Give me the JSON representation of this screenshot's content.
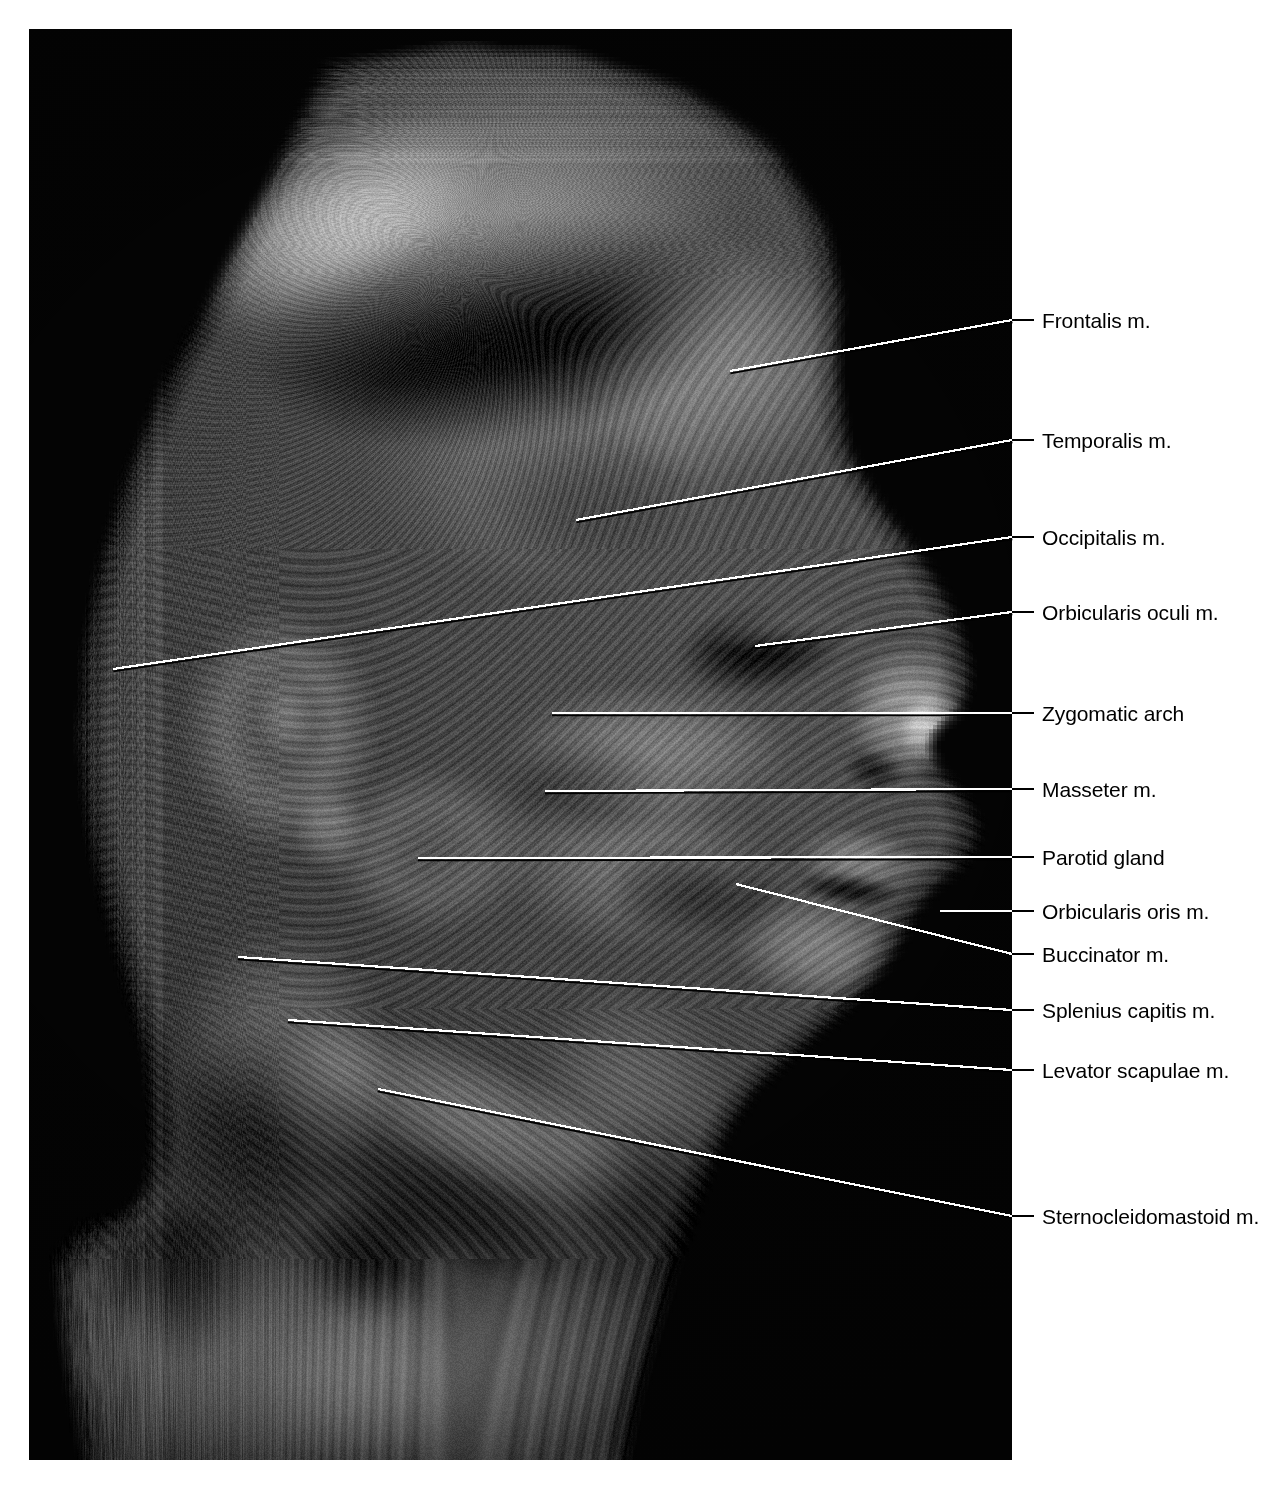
{
  "plate": {
    "title": "Lateral view of head and neck — superficial dissection",
    "width": 1287,
    "height": 1489,
    "background_color": "#ffffff",
    "photo": {
      "x": 29,
      "y": 29,
      "width": 983,
      "height": 1431,
      "background_color": "#000000",
      "description": "Black-and-white cadaveric dissection photograph, right lateral view of head and neck, scalp reflected, facial and cervical musculature exposed"
    },
    "leader_line_colors": {
      "inside_photo": "#ffffff",
      "outside_photo": "#000000"
    },
    "label_text_color": "#000000",
    "label_font_size_px": 21,
    "label_left_x": 1042
  },
  "labels": [
    {
      "id": "frontalis",
      "text": "Frontalis m.",
      "text_y": 320,
      "stub_x1": 1012,
      "stub_x2": 1034,
      "stub_y": 320,
      "anchor_x": 730,
      "anchor_y": 371
    },
    {
      "id": "temporalis",
      "text": "Temporalis m.",
      "text_y": 440,
      "stub_x1": 1012,
      "stub_x2": 1034,
      "stub_y": 440,
      "anchor_x": 576,
      "anchor_y": 520
    },
    {
      "id": "occipitalis",
      "text": "Occipitalis m.",
      "text_y": 537,
      "stub_x1": 1012,
      "stub_x2": 1034,
      "stub_y": 537,
      "anchor_x": 113,
      "anchor_y": 669
    },
    {
      "id": "orbicularis-oculi",
      "text": "Orbicularis oculi m.",
      "text_y": 612,
      "stub_x1": 1012,
      "stub_x2": 1034,
      "stub_y": 612,
      "anchor_x": 755,
      "anchor_y": 646
    },
    {
      "id": "zygomatic-arch",
      "text": "Zygomatic arch",
      "text_y": 713,
      "stub_x1": 1012,
      "stub_x2": 1034,
      "stub_y": 713,
      "anchor_x": 552,
      "anchor_y": 713
    },
    {
      "id": "masseter",
      "text": "Masseter m.",
      "text_y": 789,
      "stub_x1": 1012,
      "stub_x2": 1034,
      "stub_y": 789,
      "anchor_x": 545,
      "anchor_y": 791
    },
    {
      "id": "parotid-gland",
      "text": "Parotid gland",
      "text_y": 857,
      "stub_x1": 1012,
      "stub_x2": 1034,
      "stub_y": 857,
      "anchor_x": 418,
      "anchor_y": 858
    },
    {
      "id": "orbicularis-oris",
      "text": "Orbicularis oris m.",
      "text_y": 911,
      "stub_x1": 1012,
      "stub_x2": 1034,
      "stub_y": 911,
      "anchor_x": 940,
      "anchor_y": 911
    },
    {
      "id": "buccinator",
      "text": "Buccinator m.",
      "text_y": 954,
      "stub_x1": 1012,
      "stub_x2": 1034,
      "stub_y": 954,
      "anchor_x": 736,
      "anchor_y": 884
    },
    {
      "id": "splenius-capitis",
      "text": "Splenius capitis m.",
      "text_y": 1010,
      "stub_x1": 1012,
      "stub_x2": 1034,
      "stub_y": 1010,
      "anchor_x": 238,
      "anchor_y": 957
    },
    {
      "id": "levator-scapulae",
      "text": "Levator scapulae m.",
      "text_y": 1070,
      "stub_x1": 1012,
      "stub_x2": 1034,
      "stub_y": 1070,
      "anchor_x": 288,
      "anchor_y": 1020
    },
    {
      "id": "sternocleidomastoid",
      "text": "Sternocleidomastoid m.",
      "text_y": 1216,
      "stub_x1": 1012,
      "stub_x2": 1034,
      "stub_y": 1216,
      "anchor_x": 378,
      "anchor_y": 1089
    }
  ]
}
